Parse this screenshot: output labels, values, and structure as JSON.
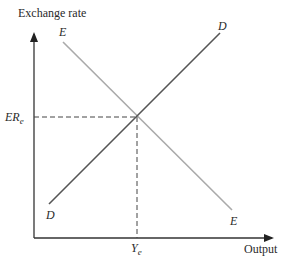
{
  "diagram": {
    "y_axis_label": "Exchange rate",
    "x_axis_label": "Output",
    "curves": [
      {
        "name": "D",
        "label_start": "D",
        "label_end": "D",
        "color": "#555555",
        "slope": "upward"
      },
      {
        "name": "E",
        "label_start": "E",
        "label_end": "E",
        "color": "#aaaaaa",
        "slope": "downward"
      }
    ],
    "equilibrium": {
      "y_label_main": "ER",
      "y_label_sub": "e",
      "x_label_main": "Y",
      "x_label_sub": "e"
    }
  }
}
